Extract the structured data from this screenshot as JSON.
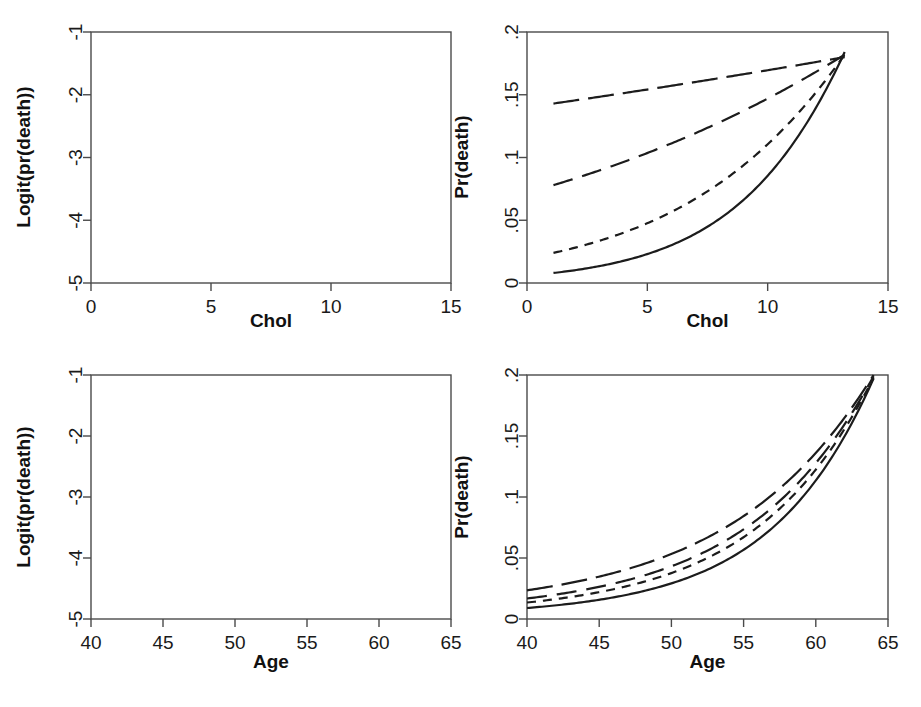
{
  "figure": {
    "background": "#ffffff",
    "ink": "#1c1c1c",
    "panel_count": 4,
    "layout": "2x2"
  },
  "chart_data": [
    {
      "id": "top-left",
      "type": "line",
      "title": "",
      "xlabel": "Chol",
      "ylabel": "Logit(pr(death))",
      "xlim": [
        0,
        15
      ],
      "ylim": [
        -5,
        -1
      ],
      "xticks": [
        0,
        5,
        10,
        15
      ],
      "xticklabels": [
        "0",
        "5",
        "10",
        "15"
      ],
      "yticks": [
        -1,
        -2,
        -3,
        -4,
        -5
      ],
      "yticklabels": [
        "-1",
        "-2",
        "-3",
        "-4",
        "-5"
      ],
      "grid": false,
      "legend": "none",
      "x": [
        1.1,
        13.2
      ],
      "series": [
        {
          "name": "curve-1",
          "dash": "solid",
          "values": [
            -4.8,
            -1.49
          ]
        },
        {
          "name": "curve-2",
          "dash": "short-dash",
          "values": [
            -3.7,
            -1.5
          ]
        },
        {
          "name": "curve-3",
          "dash": "long-dash",
          "values": [
            -2.47,
            -1.5
          ]
        },
        {
          "name": "curve-4",
          "dash": "dash-dot",
          "values": [
            -1.79,
            -1.52
          ]
        }
      ]
    },
    {
      "id": "top-right",
      "type": "line",
      "title": "",
      "xlabel": "Chol",
      "ylabel": "Pr(death)",
      "xlim": [
        0,
        15
      ],
      "ylim": [
        0,
        0.2
      ],
      "xticks": [
        0,
        5,
        10,
        15
      ],
      "xticklabels": [
        "0",
        "5",
        "10",
        "15"
      ],
      "yticks": [
        0,
        0.05,
        0.1,
        0.15,
        0.2
      ],
      "yticklabels": [
        "0",
        ".05",
        ".1",
        ".15",
        ".2"
      ],
      "grid": false,
      "legend": "none",
      "x": [
        1.1,
        13.2
      ],
      "series": [
        {
          "name": "curve-1",
          "dash": "solid",
          "values": [
            0.008,
            0.184
          ]
        },
        {
          "name": "curve-2",
          "dash": "short-dash",
          "values": [
            0.024,
            0.182
          ]
        },
        {
          "name": "curve-3",
          "dash": "long-dash",
          "values": [
            0.078,
            0.182
          ]
        },
        {
          "name": "curve-4",
          "dash": "dash-dot",
          "values": [
            0.143,
            0.18
          ]
        }
      ]
    },
    {
      "id": "bottom-left",
      "type": "line",
      "title": "",
      "xlabel": "Age",
      "ylabel": "Logit(pr(death))",
      "xlim": [
        40,
        65
      ],
      "ylim": [
        -5,
        -1
      ],
      "xticks": [
        40,
        45,
        50,
        55,
        60,
        65
      ],
      "xticklabels": [
        "40",
        "45",
        "50",
        "55",
        "60",
        "65"
      ],
      "yticks": [
        -1,
        -2,
        -3,
        -4,
        -5
      ],
      "yticklabels": [
        "-1",
        "-2",
        "-3",
        "-4",
        "-5"
      ],
      "grid": false,
      "legend": "none",
      "x": [
        40,
        64
      ],
      "series": [
        {
          "name": "curve-1",
          "dash": "solid",
          "values": [
            -4.7,
            -1.4
          ]
        },
        {
          "name": "curve-2",
          "dash": "short-dash",
          "values": [
            -4.28,
            -1.4
          ]
        },
        {
          "name": "curve-3",
          "dash": "long-dash",
          "values": [
            -4.05,
            -1.39
          ]
        },
        {
          "name": "curve-4",
          "dash": "dash-dot",
          "values": [
            -3.72,
            -1.38
          ]
        }
      ]
    },
    {
      "id": "bottom-right",
      "type": "line",
      "title": "",
      "xlabel": "Age",
      "ylabel": "Pr(death)",
      "xlim": [
        40,
        65
      ],
      "ylim": [
        0,
        0.2
      ],
      "xticks": [
        40,
        45,
        50,
        55,
        60,
        65
      ],
      "xticklabels": [
        "40",
        "45",
        "50",
        "55",
        "60",
        "65"
      ],
      "yticks": [
        0,
        0.05,
        0.1,
        0.15,
        0.2
      ],
      "yticklabels": [
        "0",
        ".05",
        ".1",
        ".15",
        ".2"
      ],
      "grid": false,
      "legend": "none",
      "x": [
        40,
        64
      ],
      "series": [
        {
          "name": "curve-1",
          "dash": "solid",
          "values": [
            0.009,
            0.197
          ]
        },
        {
          "name": "curve-2",
          "dash": "short-dash",
          "values": [
            0.0135,
            0.198
          ]
        },
        {
          "name": "curve-3",
          "dash": "long-dash",
          "values": [
            0.0168,
            0.199
          ]
        },
        {
          "name": "curve-4",
          "dash": "dash-dot",
          "values": [
            0.0235,
            0.2
          ]
        }
      ]
    }
  ]
}
